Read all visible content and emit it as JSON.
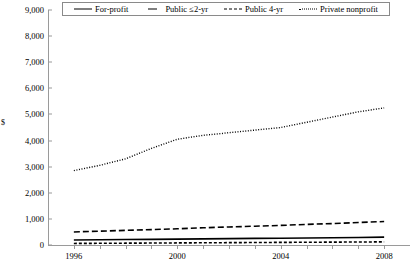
{
  "chart_data": {
    "type": "line",
    "title": "",
    "xlabel": "",
    "ylabel": "$",
    "x": [
      1996,
      1997,
      1998,
      1999,
      2000,
      2001,
      2002,
      2003,
      2004,
      2005,
      2006,
      2007,
      2008
    ],
    "xtick_labels": [
      "1996",
      "2000",
      "2004",
      "2008"
    ],
    "xtick_values": [
      1996,
      2000,
      2004,
      2008
    ],
    "xlim": [
      1995,
      2009
    ],
    "ytick_labels": [
      "0",
      "1,000",
      "2,000",
      "3,000",
      "4,000",
      "5,000",
      "6,000",
      "7,000",
      "8,000",
      "9,000"
    ],
    "ytick_values": [
      0,
      1000,
      2000,
      3000,
      4000,
      5000,
      6000,
      7000,
      8000,
      9000
    ],
    "ylim": [
      0,
      9000
    ],
    "grid": false,
    "legend_position": "top",
    "series": [
      {
        "name": "For-profit",
        "style": "solid",
        "color": "#000000",
        "values": [
          190,
          200,
          210,
          215,
          225,
          235,
          245,
          255,
          260,
          270,
          280,
          290,
          300
        ]
      },
      {
        "name": "Public ≤2-yr",
        "style": "short-dash",
        "color": "#000000",
        "values": [
          60,
          65,
          70,
          75,
          80,
          85,
          90,
          95,
          100,
          105,
          110,
          115,
          120
        ]
      },
      {
        "name": "Public 4-yr",
        "style": "dashed",
        "color": "#000000",
        "values": [
          500,
          530,
          560,
          590,
          620,
          660,
          690,
          720,
          750,
          790,
          820,
          860,
          900
        ]
      },
      {
        "name": "Private nonprofit",
        "style": "dotted",
        "color": "#000000",
        "values": [
          2850,
          3050,
          3300,
          3700,
          4050,
          4200,
          4300,
          4400,
          4500,
          4700,
          4900,
          5100,
          5250
        ]
      }
    ]
  },
  "legend": {
    "items": [
      {
        "label": "For-profit",
        "style": "solid"
      },
      {
        "label": "Public ≤2-yr",
        "style": "solid2"
      },
      {
        "label": "Public 4-yr",
        "style": "dash"
      },
      {
        "label": "Private nonprofit",
        "style": "dot"
      }
    ]
  }
}
